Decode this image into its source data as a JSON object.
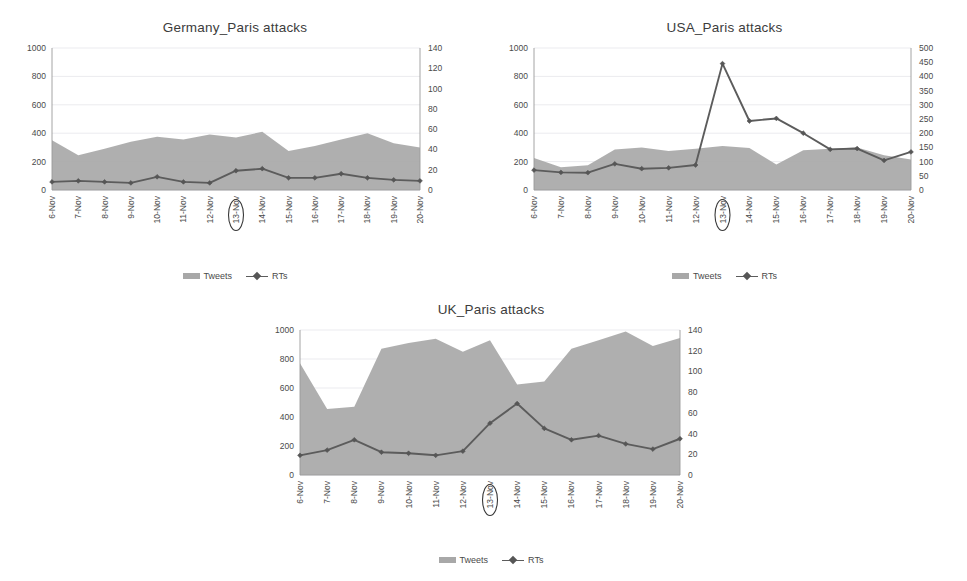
{
  "page": {
    "background": "#ffffff",
    "series_colors": {
      "tweets_area": "#a8a8a8",
      "rts_line": "#5c5c5c"
    }
  },
  "legend": {
    "tweets_label": "Tweets",
    "rts_label": "RTs"
  },
  "charts": [
    {
      "id": "germany",
      "title": "Germany_Paris attacks",
      "highlight_category": "13-Nov"
    },
    {
      "id": "usa",
      "title": "USA_Paris attacks",
      "highlight_category": "13-Nov"
    },
    {
      "id": "uk",
      "title": "UK_Paris attacks",
      "highlight_category": "13-Nov"
    }
  ],
  "chart_data": [
    {
      "id": "germany",
      "type": "area",
      "title": "Germany_Paris attacks",
      "xlabel": "",
      "ylabel": "",
      "grid": true,
      "legend_position": "bottom",
      "categories": [
        "6-Nov",
        "7-Nov",
        "8-Nov",
        "9-Nov",
        "10-Nov",
        "11-Nov",
        "12-Nov",
        "13-Nov",
        "14-Nov",
        "15-Nov",
        "16-Nov",
        "17-Nov",
        "18-Nov",
        "19-Nov",
        "20-Nov"
      ],
      "axes": {
        "left": {
          "label": "Tweets",
          "min": 0,
          "max": 1000,
          "ticks": [
            0,
            200,
            400,
            600,
            800,
            1000
          ]
        },
        "right": {
          "label": "RTs",
          "min": 0,
          "max": 140,
          "ticks": [
            0,
            20,
            40,
            60,
            80,
            100,
            120,
            140
          ]
        }
      },
      "series": [
        {
          "name": "Tweets",
          "axis": "left",
          "render": "area",
          "values": [
            350,
            245,
            290,
            340,
            375,
            355,
            390,
            370,
            410,
            275,
            310,
            355,
            400,
            330,
            300
          ]
        },
        {
          "name": "RTs",
          "axis": "right",
          "render": "line",
          "values": [
            8,
            9,
            8,
            7,
            13,
            8,
            7,
            19,
            21,
            12,
            12,
            16,
            12,
            10,
            9
          ]
        }
      ],
      "annotations": [
        {
          "type": "ellipse",
          "target": "13-Nov",
          "where": "x-axis-tick-label"
        }
      ]
    },
    {
      "id": "usa",
      "type": "area",
      "title": "USA_Paris attacks",
      "xlabel": "",
      "ylabel": "",
      "grid": true,
      "legend_position": "bottom",
      "categories": [
        "6-Nov",
        "7-Nov",
        "8-Nov",
        "9-Nov",
        "10-Nov",
        "11-Nov",
        "12-Nov",
        "13-Nov",
        "14-Nov",
        "15-Nov",
        "16-Nov",
        "17-Nov",
        "18-Nov",
        "19-Nov",
        "20-Nov"
      ],
      "axes": {
        "left": {
          "label": "Tweets",
          "min": 0,
          "max": 1000,
          "ticks": [
            0,
            200,
            400,
            600,
            800,
            1000
          ]
        },
        "right": {
          "label": "RTs",
          "min": 0,
          "max": 500,
          "ticks": [
            0,
            50,
            100,
            150,
            200,
            250,
            300,
            350,
            400,
            450,
            500
          ]
        }
      },
      "series": [
        {
          "name": "Tweets",
          "axis": "left",
          "render": "area",
          "values": [
            225,
            160,
            175,
            285,
            300,
            275,
            290,
            310,
            295,
            180,
            280,
            290,
            300,
            245,
            215
          ]
        },
        {
          "name": "RTs",
          "axis": "right",
          "render": "line",
          "values": [
            70,
            62,
            61,
            92,
            75,
            78,
            88,
            445,
            243,
            252,
            200,
            143,
            146,
            104,
            134
          ]
        }
      ],
      "annotations": [
        {
          "type": "ellipse",
          "target": "13-Nov",
          "where": "x-axis-tick-label"
        }
      ]
    },
    {
      "id": "uk",
      "type": "area",
      "title": "UK_Paris attacks",
      "xlabel": "",
      "ylabel": "",
      "grid": true,
      "legend_position": "bottom",
      "categories": [
        "6-Nov",
        "7-Nov",
        "8-Nov",
        "9-Nov",
        "10-Nov",
        "11-Nov",
        "12-Nov",
        "13-Nov",
        "14-Nov",
        "15-Nov",
        "16-Nov",
        "17-Nov",
        "18-Nov",
        "19-Nov",
        "20-Nov"
      ],
      "axes": {
        "left": {
          "label": "Tweets",
          "min": 0,
          "max": 1000,
          "ticks": [
            0,
            200,
            400,
            600,
            800,
            1000
          ]
        },
        "right": {
          "label": "RTs",
          "min": 0,
          "max": 140,
          "ticks": [
            0,
            20,
            40,
            60,
            80,
            100,
            120,
            140
          ]
        }
      },
      "series": [
        {
          "name": "Tweets",
          "axis": "left",
          "render": "area",
          "values": [
            770,
            455,
            470,
            870,
            910,
            940,
            850,
            930,
            625,
            645,
            870,
            930,
            990,
            890,
            945
          ]
        },
        {
          "name": "RTs",
          "axis": "right",
          "render": "line",
          "values": [
            19,
            24,
            34,
            22,
            21,
            19,
            23,
            50,
            69,
            45,
            34,
            38,
            30,
            25,
            35
          ]
        }
      ],
      "annotations": [
        {
          "type": "ellipse",
          "target": "13-Nov",
          "where": "x-axis-tick-label"
        }
      ]
    }
  ]
}
